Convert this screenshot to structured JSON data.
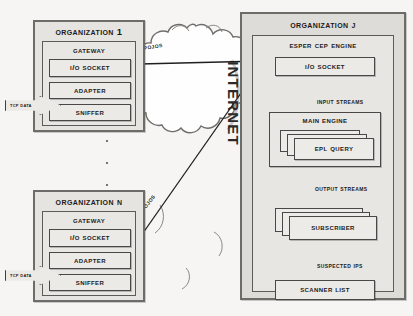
{
  "figure": {
    "background_color": "#f6f5f3",
    "ink_color": "#2a2a2a",
    "panel_fill": "#e6e4e1",
    "box_fill": "#eceae7"
  },
  "internet": {
    "label": "INTERNET",
    "shape": "cloud-shape"
  },
  "flow_labels": {
    "pojos_top": "POJOs",
    "pojos_bottom": "POJOs"
  },
  "organizations": [
    {
      "title": "ORGANIZATION 1",
      "gateway_title": "GATEWAY",
      "inbound_label": "TCP DATA",
      "components": [
        {
          "label": "I/O SOCKET"
        },
        {
          "label": "ADAPTER"
        },
        {
          "label": "SNIFFER"
        }
      ]
    },
    {
      "title": "ORGANIZATION N",
      "gateway_title": "GATEWAY",
      "inbound_label": "TCP DATA",
      "components": [
        {
          "label": "I/O SOCKET"
        },
        {
          "label": "ADAPTER"
        },
        {
          "label": "SNIFFER"
        }
      ]
    }
  ],
  "ellipsis": "vertical-dots",
  "organization_j": {
    "title": "ORGANIZATION J",
    "engine_title": "ESPER CEP ENGINE",
    "io_socket": "I/O SOCKET",
    "edge_input_streams": "INPUT STREAMS",
    "main_engine_title": "MAIN ENGINE",
    "epl_query": "EPL QUERY",
    "edge_output_streams": "OUTPUT STREAMS",
    "subscriber": "SUBSCRIBER",
    "edge_suspected_ips": "SUSPECTED IPs",
    "scanner_list": "SCANNER LIST"
  }
}
